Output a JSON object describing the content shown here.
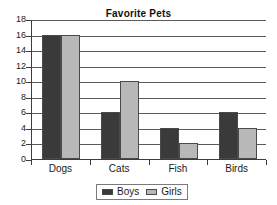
{
  "chart_data": {
    "type": "bar",
    "title": "Favorite Pets",
    "xlabel": "",
    "ylabel": "",
    "categories": [
      "Dogs",
      "Cats",
      "Fish",
      "Birds"
    ],
    "series": [
      {
        "name": "Boys",
        "color": "#3a3a3a",
        "values": [
          16,
          6,
          4,
          6
        ]
      },
      {
        "name": "Girls",
        "color": "#b8b8b8",
        "values": [
          16,
          10,
          2,
          4
        ]
      }
    ],
    "ylim": [
      0,
      18
    ],
    "ytick_step": 2,
    "yticks": [
      0,
      2,
      4,
      6,
      8,
      10,
      12,
      14,
      16,
      18
    ],
    "ytick_labels": [
      "0",
      "2",
      "4",
      "6",
      "8",
      "10",
      "12",
      "14",
      "16",
      "18"
    ],
    "grid": "horizontal",
    "legend_position": "bottom",
    "legend_entries": [
      "Boys",
      "Girls"
    ],
    "background_color": "#ffffff",
    "axis_color": "#3d3d3d",
    "gridline_color": "#5a5a5a"
  }
}
